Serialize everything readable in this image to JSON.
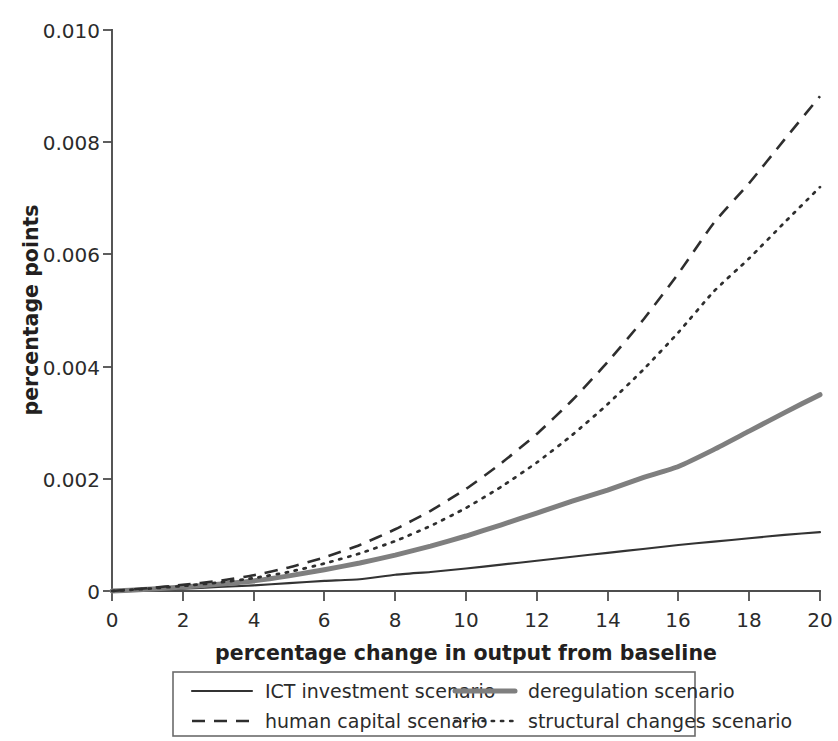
{
  "chart_data": {
    "type": "line",
    "title": "",
    "xlabel": "percentage change in output from baseline",
    "ylabel": "percentage points",
    "xlim": [
      0,
      20
    ],
    "ylim": [
      0,
      0.01
    ],
    "xticks": [
      "0",
      "2",
      "4",
      "6",
      "8",
      "10",
      "12",
      "14",
      "16",
      "18",
      "20"
    ],
    "yticks": [
      "0",
      "0.002",
      "0.004",
      "0.006",
      "0.008",
      "0.010"
    ],
    "grid": false,
    "legend_position": "below-axes",
    "x": [
      0,
      1,
      2,
      3,
      4,
      5,
      6,
      7,
      8,
      9,
      10,
      11,
      12,
      13,
      14,
      15,
      16,
      17,
      18,
      19,
      20
    ],
    "series": [
      {
        "name": "ICT investment scenario",
        "style": "solid-thin",
        "color": "#333333",
        "values": [
          0,
          2e-05,
          4e-05,
          7e-05,
          0.0001,
          0.00014,
          0.00018,
          0.00021,
          0.00029,
          0.00034,
          0.0004,
          0.00047,
          0.00054,
          0.00061,
          0.00068,
          0.00075,
          0.00082,
          0.00088,
          0.00094,
          0.001,
          0.00105
        ]
      },
      {
        "name": "deregulation scenario",
        "style": "solid-thick-gray",
        "color": "#7f7f7f",
        "values": [
          0,
          3e-05,
          7e-05,
          0.00012,
          0.00018,
          0.00027,
          0.00038,
          0.0005,
          0.00064,
          0.0008,
          0.00098,
          0.00118,
          0.00139,
          0.0016,
          0.0018,
          0.00202,
          0.00222,
          0.00252,
          0.00285,
          0.00318,
          0.0035
        ]
      },
      {
        "name": "human capital scenario",
        "style": "dashed",
        "color": "#2e2e2e",
        "values": [
          0,
          5e-05,
          0.00011,
          0.00018,
          0.00028,
          0.00042,
          0.0006,
          0.00082,
          0.0011,
          0.00143,
          0.00182,
          0.00228,
          0.0028,
          0.0034,
          0.00408,
          0.00483,
          0.00566,
          0.00656,
          0.00727,
          0.00805,
          0.00882
        ]
      },
      {
        "name": "structural changes scenario",
        "style": "dotted",
        "color": "#2e2e2e",
        "values": [
          0,
          4e-05,
          9e-05,
          0.00015,
          0.00023,
          0.00034,
          0.00049,
          0.00067,
          0.00089,
          0.00116,
          0.00148,
          0.00186,
          0.00229,
          0.00278,
          0.00333,
          0.00394,
          0.00461,
          0.00534,
          0.00593,
          0.00657,
          0.0072
        ]
      }
    ]
  },
  "legend": {
    "items": [
      {
        "label": "ICT investment scenario",
        "style": "solid-thin"
      },
      {
        "label": "deregulation scenario",
        "style": "solid-thick-gray"
      },
      {
        "label": "human capital scenario",
        "style": "dashed"
      },
      {
        "label": "structural changes scenario",
        "style": "dotted"
      }
    ]
  }
}
